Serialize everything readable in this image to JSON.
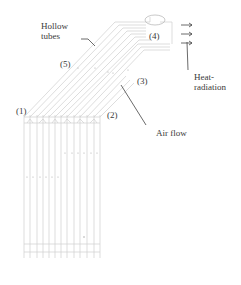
{
  "diagram": {
    "labels": {
      "hollow_tubes_line1": "Hollow",
      "hollow_tubes_line2": "tubes",
      "heat_radiation_line1": "Heat-",
      "heat_radiation_line2": "radiation",
      "air_flow": "Air flow",
      "marker_1": "(1)",
      "marker_2": "(2)",
      "marker_3": "(3)",
      "marker_4": "(4)",
      "marker_5": "(5)"
    },
    "arrows": {
      "count": 3,
      "icon": "right-arrow-icon"
    },
    "colors": {
      "tube_line": "#c8c8c8",
      "leader_line": "#333333",
      "text": "#3a3a3a"
    }
  }
}
